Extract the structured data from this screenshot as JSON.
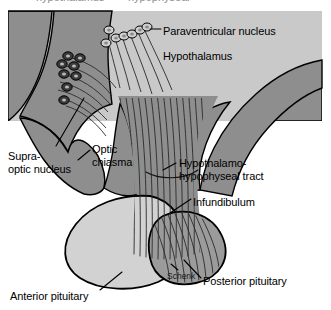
{
  "figure": {
    "type": "anatomical-diagram",
    "signature": "Schenk",
    "clipped_header_fragments": {
      "left": "hypothalamus",
      "right": "hypophyseal"
    },
    "background_color": "#ffffff",
    "panel_color": "#c9c9c9",
    "brain_tissue_color": "#8e8e8e",
    "stalk_color": "#8e8e8e",
    "anterior_pituitary_color": "#d2d2d2",
    "posterior_pituitary_color": "#9b9b9b",
    "outline_color": "#000000"
  },
  "labels": {
    "paraventricular_nucleus": "Paraventricular nucleus",
    "hypothalamus": "Hypothalamus",
    "supraoptic_nucleus_line1": "Supra-",
    "supraoptic_nucleus_line2": "optic nucleus",
    "optic_chiasma_line1": "Optic",
    "optic_chiasma_line2": "chiasma",
    "hht_line1": "Hypothalamo-",
    "hht_line2": "hypophyseal tract",
    "infundibulum": "Infundibulum",
    "posterior_pituitary": "Posterior pituitary",
    "anterior_pituitary": "Anterior pituitary",
    "artist_signature": "Schenk"
  },
  "structures": [
    {
      "name": "paraventricular-nucleus",
      "neuron_count": 7,
      "neuron_shade": "#d8d8d8"
    },
    {
      "name": "supraoptic-nucleus",
      "neuron_count": 8,
      "neuron_shade": "#4a4a4a"
    },
    {
      "name": "hypothalamus",
      "shade": "#c9c9c9"
    },
    {
      "name": "optic-chiasma",
      "shade": "#8e8e8e"
    },
    {
      "name": "infundibulum",
      "shade": "#8e8e8e"
    },
    {
      "name": "hypothalamo-hypophyseal-tract",
      "fiber_count": 14
    },
    {
      "name": "anterior-pituitary",
      "shade": "#d2d2d2"
    },
    {
      "name": "posterior-pituitary",
      "shade": "#9b9b9b"
    }
  ]
}
